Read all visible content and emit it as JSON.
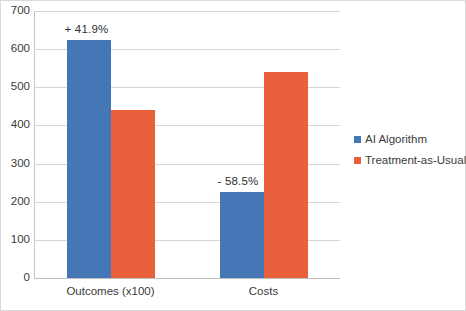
{
  "chart_data": {
    "type": "bar",
    "title": "",
    "xlabel": "",
    "ylabel": "",
    "categories": [
      "Outcomes (x100)",
      "Costs"
    ],
    "series": [
      {
        "name": "AI Algorithm",
        "color": "#4576b5",
        "values": [
          625,
          225
        ]
      },
      {
        "name": "Treatment-as-Usual",
        "color": "#e8603c",
        "values": [
          440,
          540
        ]
      }
    ],
    "annotations": [
      {
        "text": "+ 41.9%",
        "category": "Outcomes (x100)",
        "series": "AI Algorithm"
      },
      {
        "text": "- 58.5%",
        "category": "Costs",
        "series": "AI Algorithm"
      }
    ],
    "ylim": [
      0,
      700
    ],
    "yticks": [
      0,
      100,
      200,
      300,
      400,
      500,
      600,
      700
    ],
    "ytick_labels": [
      "0",
      "100",
      "200",
      "300",
      "400",
      "500",
      "600",
      "700"
    ],
    "grid": true,
    "legend_position": "right"
  },
  "legend": {
    "items": [
      {
        "label": "AI Algorithm",
        "color": "#4576b5"
      },
      {
        "label": "Treatment-as-Usual",
        "color": "#e8603c"
      }
    ]
  }
}
